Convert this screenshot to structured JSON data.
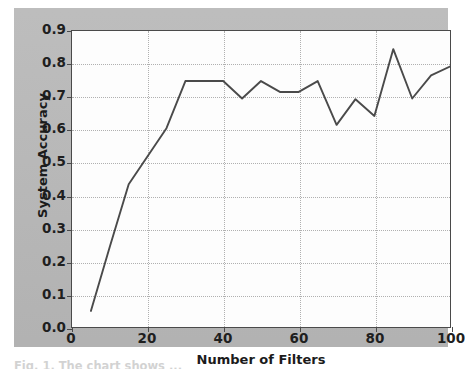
{
  "figure": {
    "background_color": "#b9b9b9",
    "plot_background_color": "#fdfdfd",
    "axis_color": "#4a4a4a",
    "grid_color": "#b0b0b0",
    "line_color": "#4a4a4a",
    "caption": "Fig. 1. The chart shows ..."
  },
  "chart_data": {
    "type": "line",
    "title": "",
    "xlabel": "Number of Filters",
    "ylabel": "System Accuracy",
    "xlim": [
      0,
      100
    ],
    "ylim": [
      0.0,
      0.9
    ],
    "grid": true,
    "legend": null,
    "xticks": [
      0,
      20,
      40,
      60,
      80,
      100
    ],
    "xtick_labels": [
      "0",
      "20",
      "40",
      "60",
      "80",
      "100"
    ],
    "yticks": [
      0.0,
      0.1,
      0.2,
      0.3,
      0.4,
      0.5,
      0.6,
      0.7,
      0.8,
      0.9
    ],
    "ytick_labels": [
      "0.0",
      "0.1",
      "0.2",
      "0.3",
      "0.4",
      "0.5",
      "0.6",
      "0.7",
      "0.8",
      "0.9"
    ],
    "series": [
      {
        "name": "System Accuracy",
        "color": "#4a4a4a",
        "x": [
          5,
          10,
          15,
          20,
          25,
          30,
          35,
          40,
          45,
          50,
          55,
          60,
          65,
          70,
          75,
          80,
          85,
          90,
          95,
          100
        ],
        "values": [
          0.05,
          0.245,
          0.435,
          0.52,
          0.605,
          0.748,
          0.748,
          0.748,
          0.695,
          0.748,
          0.715,
          0.715,
          0.748,
          0.615,
          0.693,
          0.642,
          0.845,
          0.695,
          0.765,
          0.792
        ]
      }
    ]
  }
}
